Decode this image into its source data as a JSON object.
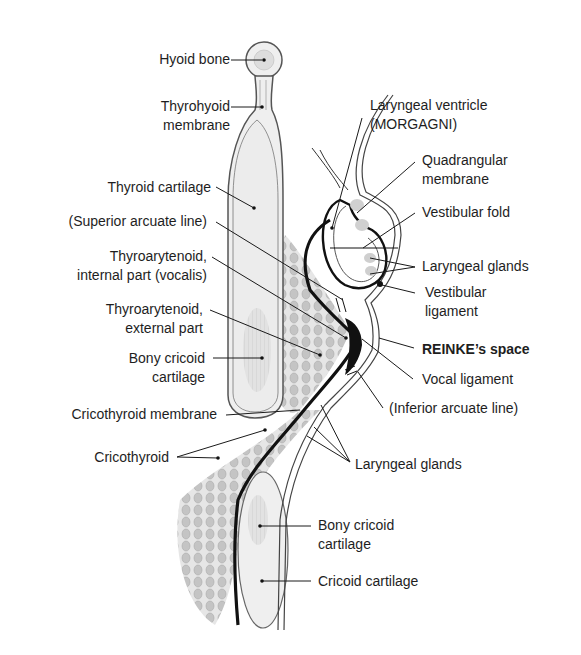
{
  "figure": {
    "type": "anatomical-diagram"
  },
  "labels_left": [
    {
      "id": "hyoid-bone",
      "lines": [
        "Hyoid bone"
      ]
    },
    {
      "id": "thyrohyoid-membrane",
      "lines": [
        "Thyrohyoid",
        "membrane"
      ]
    },
    {
      "id": "thyroid-cartilage",
      "lines": [
        "Thyroid cartilage"
      ]
    },
    {
      "id": "superior-arcuate-line",
      "lines": [
        "(Superior arcuate line)"
      ]
    },
    {
      "id": "thyroarytenoid-internal",
      "lines": [
        "Thyroarytenoid,",
        "internal part (vocalis)"
      ]
    },
    {
      "id": "thyroarytenoid-external",
      "lines": [
        "Thyroarytenoid,",
        "external part"
      ]
    },
    {
      "id": "bony-cricoid-cartilage-upper",
      "lines": [
        "Bony cricoid",
        "cartilage"
      ]
    },
    {
      "id": "cricothyroid-membrane",
      "lines": [
        "Cricothyroid membrane"
      ]
    },
    {
      "id": "cricothyroid",
      "lines": [
        "Cricothyroid"
      ]
    }
  ],
  "labels_right": [
    {
      "id": "laryngeal-ventricle",
      "lines": [
        "Laryngeal ventricle",
        "(MORGAGNI)"
      ]
    },
    {
      "id": "quadrangular-membrane",
      "lines": [
        "Quadrangular",
        "membrane"
      ]
    },
    {
      "id": "vestibular-fold",
      "lines": [
        "Vestibular fold"
      ]
    },
    {
      "id": "laryngeal-glands-upper",
      "lines": [
        "Laryngeal glands"
      ]
    },
    {
      "id": "vestibular-ligament",
      "lines": [
        "Vestibular",
        "ligament"
      ]
    },
    {
      "id": "reinkes-space",
      "lines": [
        "REINKE’s space"
      ],
      "bold": true
    },
    {
      "id": "vocal-ligament",
      "lines": [
        "Vocal ligament"
      ]
    },
    {
      "id": "inferior-arcuate-line",
      "lines": [
        "(Inferior arcuate line)"
      ]
    },
    {
      "id": "laryngeal-glands-lower",
      "lines": [
        "Laryngeal glands"
      ]
    },
    {
      "id": "bony-cricoid-cartilage-lower",
      "lines": [
        "Bony cricoid",
        "cartilage"
      ]
    },
    {
      "id": "cricoid-cartilage",
      "lines": [
        "Cricoid cartilage"
      ]
    }
  ],
  "colors": {
    "line": "#1a1a1a",
    "cartilage_fill": "#eeeeee",
    "bone_fill": "#dcdcdc",
    "muscle_fill": "#c8c8c8",
    "dark_fill": "#111111"
  }
}
